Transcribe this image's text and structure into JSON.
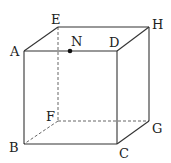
{
  "diagram": {
    "type": "cube",
    "vertices": {
      "A": {
        "label": "A",
        "x": 24,
        "y": 51
      },
      "B": {
        "label": "B",
        "x": 24,
        "y": 144
      },
      "C": {
        "label": "C",
        "x": 117,
        "y": 144
      },
      "D": {
        "label": "D",
        "x": 117,
        "y": 51
      },
      "E": {
        "label": "E",
        "x": 58,
        "y": 27
      },
      "F": {
        "label": "F",
        "x": 58,
        "y": 121
      },
      "G": {
        "label": "G",
        "x": 149,
        "y": 121
      },
      "H": {
        "label": "H",
        "x": 149,
        "y": 27
      }
    },
    "point_N": {
      "label": "N",
      "x": 70,
      "y": 51,
      "on_edge": "AD"
    },
    "solid_edges": [
      "AB",
      "BC",
      "CD",
      "DA",
      "AE",
      "EH",
      "HD",
      "HG",
      "GC"
    ],
    "dashed_edges": [
      "EF",
      "FB",
      "FG"
    ],
    "colors": {
      "line": "#333333",
      "point": "#111111"
    }
  }
}
